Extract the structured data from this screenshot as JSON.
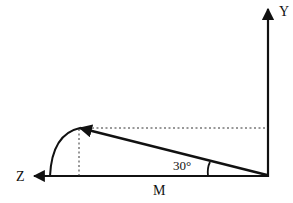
{
  "diagram": {
    "type": "vector-angle-diagram",
    "axes": {
      "y_label": "Y",
      "z_label": "Z"
    },
    "vector_label": "M",
    "angle_label": "30°",
    "angle_degrees": 30,
    "colors": {
      "stroke": "#111111",
      "background": "#ffffff"
    }
  }
}
